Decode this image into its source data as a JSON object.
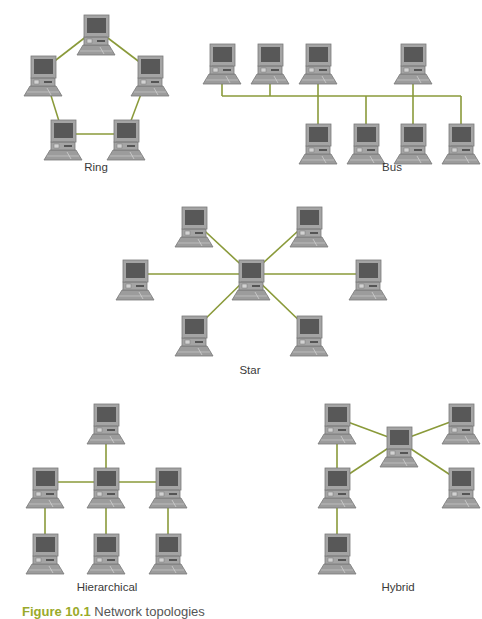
{
  "colors": {
    "link": "#8a9a3a",
    "case": "#a4a4a4",
    "case_edge": "#7a7a7a",
    "screen": "#585858",
    "keyboard": "#9c9c9c",
    "label_text": "#3a3a3a"
  },
  "topologies": [
    {
      "id": "ring",
      "label": "Ring",
      "node_count": 5,
      "links": [
        [
          0,
          1
        ],
        [
          0,
          2
        ],
        [
          1,
          3
        ],
        [
          2,
          4
        ],
        [
          3,
          4
        ]
      ]
    },
    {
      "id": "bus",
      "label": "Bus",
      "node_count": 8,
      "links": "shared-bus"
    },
    {
      "id": "star",
      "label": "Star",
      "node_count": 7,
      "links": [
        [
          0,
          1
        ],
        [
          0,
          2
        ],
        [
          0,
          3
        ],
        [
          0,
          4
        ],
        [
          0,
          5
        ],
        [
          0,
          6
        ]
      ]
    },
    {
      "id": "hierarchical",
      "label": "Hierarchical",
      "node_count": 7,
      "links": [
        [
          0,
          2
        ],
        [
          1,
          2
        ],
        [
          2,
          3
        ],
        [
          1,
          4
        ],
        [
          2,
          5
        ],
        [
          3,
          6
        ]
      ]
    },
    {
      "id": "hybrid",
      "label": "Hybrid",
      "node_count": 6,
      "links": [
        [
          0,
          1
        ],
        [
          0,
          2
        ],
        [
          0,
          3
        ],
        [
          0,
          4
        ],
        [
          2,
          3
        ],
        [
          3,
          5
        ]
      ]
    }
  ],
  "caption": {
    "figure": "Figure 10.1",
    "text": "Network topologies"
  }
}
